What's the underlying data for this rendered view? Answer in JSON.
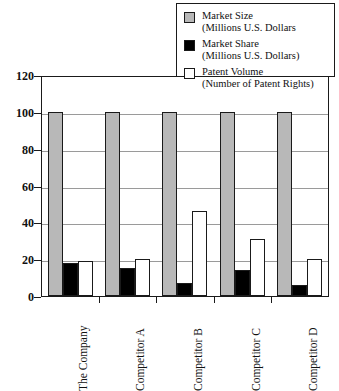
{
  "chart_data": {
    "type": "bar",
    "title": "",
    "xlabel": "",
    "ylabel": "",
    "ylim": [
      0,
      120
    ],
    "yticks": [
      0,
      20,
      40,
      60,
      80,
      100,
      120
    ],
    "grid": true,
    "legend_position": "top-right",
    "categories": [
      "The Company",
      "Competitor A",
      "Competitor B",
      "Competitor C",
      "Competitor D"
    ],
    "series": [
      {
        "name": "Market Size",
        "unit": "(Millions U.S. Dollars",
        "color": "#b8b8b8",
        "values": [
          100,
          100,
          100,
          100,
          100
        ]
      },
      {
        "name": "Market Share",
        "unit": "(Millions U.S. Dollars)",
        "color": "#000000",
        "values": [
          18,
          15,
          7,
          14,
          6
        ]
      },
      {
        "name": "Patent Volume",
        "unit": "(Number of Patent Rights)",
        "color": "#ffffff",
        "values": [
          19,
          20,
          46,
          31,
          20
        ]
      }
    ]
  },
  "legend": {
    "items": [
      {
        "label": "Market Size",
        "sublabel": "(Millions U.S. Dollars",
        "swatch": "gray-swatch"
      },
      {
        "label": "Market Share",
        "sublabel": "(Millions U.S. Dollars)",
        "swatch": "black-swatch"
      },
      {
        "label": "Patent Volume",
        "sublabel": "(Number of Patent Rights)",
        "swatch": "white-swatch"
      }
    ]
  }
}
